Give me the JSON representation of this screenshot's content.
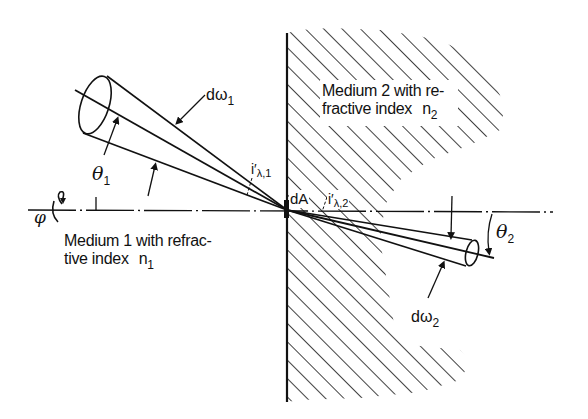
{
  "figure": {
    "medium2": {
      "line1": "Medium 2 with re-",
      "line2_prefix": "fractive index ",
      "line2_symbol": "n",
      "line2_sub": "2"
    },
    "medium1": {
      "line1": "Medium 1 with refrac-",
      "line2_prefix": "tive index ",
      "line2_symbol": "n",
      "line2_sub": "1"
    },
    "labels": {
      "d_omega_1": {
        "prefix": "dω",
        "sub": "1"
      },
      "d_omega_2": {
        "prefix": "dω",
        "sub": "2"
      },
      "theta_1": {
        "symbol": "θ",
        "sub": "1"
      },
      "theta_2": {
        "symbol": "θ",
        "sub": "2"
      },
      "phi": "φ",
      "dA": "dA",
      "i_lambda_1": {
        "symbol": "i′",
        "sub": "λ,1"
      },
      "i_lambda_2": {
        "symbol": "i′",
        "sub": "λ,2"
      }
    },
    "colors": {
      "ink": "#111111",
      "background": "#ffffff"
    }
  }
}
